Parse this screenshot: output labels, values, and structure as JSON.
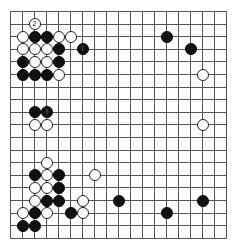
{
  "board": {
    "size": 19,
    "origin_x": 10,
    "origin_y": 11,
    "spacing_x": 12,
    "spacing_y": 12.6,
    "stone_diameter": 12,
    "line_color": "#555555",
    "background": "#ffffff"
  },
  "stones": [
    {
      "color": "white",
      "col": 2,
      "row": 1,
      "label": "2"
    },
    {
      "color": "white",
      "col": 1,
      "row": 2,
      "label": ""
    },
    {
      "color": "black",
      "col": 2,
      "row": 2,
      "label": ""
    },
    {
      "color": "black",
      "col": 3,
      "row": 2,
      "label": ""
    },
    {
      "color": "white",
      "col": 4,
      "row": 2,
      "label": ""
    },
    {
      "color": "white",
      "col": 5,
      "row": 2,
      "label": ""
    },
    {
      "color": "white",
      "col": 1,
      "row": 3,
      "label": ""
    },
    {
      "color": "white",
      "col": 2,
      "row": 3,
      "label": ""
    },
    {
      "color": "white",
      "col": 3,
      "row": 3,
      "label": ""
    },
    {
      "color": "black",
      "col": 4,
      "row": 3,
      "label": ""
    },
    {
      "color": "black",
      "col": 6,
      "row": 3,
      "label": "1"
    },
    {
      "color": "black",
      "col": 1,
      "row": 4,
      "label": ""
    },
    {
      "color": "white",
      "col": 2,
      "row": 4,
      "label": ""
    },
    {
      "color": "white",
      "col": 3,
      "row": 4,
      "label": ""
    },
    {
      "color": "black",
      "col": 4,
      "row": 4,
      "label": ""
    },
    {
      "color": "black",
      "col": 1,
      "row": 5,
      "label": ""
    },
    {
      "color": "black",
      "col": 2,
      "row": 5,
      "label": ""
    },
    {
      "color": "black",
      "col": 3,
      "row": 5,
      "label": ""
    },
    {
      "color": "white",
      "col": 4,
      "row": 5,
      "label": ""
    },
    {
      "color": "black",
      "col": 13,
      "row": 2,
      "label": ""
    },
    {
      "color": "black",
      "col": 15,
      "row": 3,
      "label": ""
    },
    {
      "color": "white",
      "col": 16,
      "row": 5,
      "label": ""
    },
    {
      "color": "white",
      "col": 16,
      "row": 9,
      "label": ""
    },
    {
      "color": "black",
      "col": 2,
      "row": 8,
      "label": ""
    },
    {
      "color": "black",
      "col": 3,
      "row": 8,
      "label": "3"
    },
    {
      "color": "white",
      "col": 2,
      "row": 9,
      "label": ""
    },
    {
      "color": "white",
      "col": 3,
      "row": 9,
      "label": ""
    },
    {
      "color": "white",
      "col": 3,
      "row": 12,
      "label": ""
    },
    {
      "color": "black",
      "col": 2,
      "row": 13,
      "label": ""
    },
    {
      "color": "white",
      "col": 3,
      "row": 13,
      "label": ""
    },
    {
      "color": "black",
      "col": 4,
      "row": 13,
      "label": ""
    },
    {
      "color": "white",
      "col": 7,
      "row": 13,
      "label": ""
    },
    {
      "color": "white",
      "col": 2,
      "row": 14,
      "label": ""
    },
    {
      "color": "white",
      "col": 3,
      "row": 14,
      "label": ""
    },
    {
      "color": "black",
      "col": 4,
      "row": 14,
      "label": ""
    },
    {
      "color": "white",
      "col": 2,
      "row": 15,
      "label": ""
    },
    {
      "color": "black",
      "col": 3,
      "row": 15,
      "label": ""
    },
    {
      "color": "black",
      "col": 4,
      "row": 15,
      "label": ""
    },
    {
      "color": "white",
      "col": 6,
      "row": 15,
      "label": ""
    },
    {
      "color": "black",
      "col": 9,
      "row": 15,
      "label": ""
    },
    {
      "color": "black",
      "col": 16,
      "row": 15,
      "label": ""
    },
    {
      "color": "white",
      "col": 1,
      "row": 16,
      "label": ""
    },
    {
      "color": "black",
      "col": 2,
      "row": 16,
      "label": ""
    },
    {
      "color": "white",
      "col": 3,
      "row": 16,
      "label": ""
    },
    {
      "color": "black",
      "col": 5,
      "row": 16,
      "label": ""
    },
    {
      "color": "white",
      "col": 6,
      "row": 16,
      "label": ""
    },
    {
      "color": "black",
      "col": 13,
      "row": 16,
      "label": ""
    },
    {
      "color": "black",
      "col": 1,
      "row": 17,
      "label": ""
    },
    {
      "color": "black",
      "col": 2,
      "row": 17,
      "label": ""
    }
  ]
}
